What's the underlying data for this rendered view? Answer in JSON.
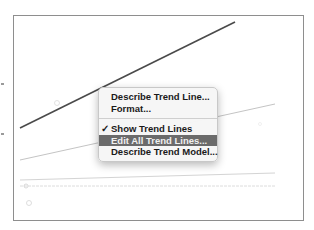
{
  "chart": {
    "frame_color": "#8e8e8e",
    "trend_lines": [
      {
        "name": "trend-line-dark",
        "x1": 20,
        "y1": 128,
        "x2": 235,
        "y2": 22,
        "color": "#4a4a4a",
        "width": 1.6
      },
      {
        "name": "trend-line-light",
        "x1": 20,
        "y1": 160,
        "x2": 275,
        "y2": 104,
        "color": "#c4c4c4",
        "width": 1
      },
      {
        "name": "trend-line-faint-upper",
        "x1": 20,
        "y1": 180,
        "x2": 275,
        "y2": 173,
        "color": "#d4d4d4",
        "width": 1
      },
      {
        "name": "trend-line-faint-lower",
        "x1": 20,
        "y1": 186,
        "x2": 275,
        "y2": 186,
        "color": "#dcdcdc",
        "width": 1
      }
    ],
    "markers": [
      {
        "cx": 57,
        "cy": 103,
        "r": 2.5
      },
      {
        "cx": 26,
        "cy": 186,
        "r": 2
      },
      {
        "cx": 29,
        "cy": 203,
        "r": 2.5
      },
      {
        "cx": 260,
        "cy": 124,
        "r": 1.5
      }
    ],
    "axis_ticks_y": [
      83,
      133
    ]
  },
  "context_menu": {
    "items": [
      {
        "label": "Describe Trend Line...",
        "checked": false,
        "highlighted": false
      },
      {
        "label": "Format...",
        "checked": false,
        "highlighted": false
      },
      {
        "separator": true
      },
      {
        "label": "Show Trend Lines",
        "checked": true,
        "highlighted": false
      },
      {
        "label": "Edit All Trend Lines...",
        "checked": false,
        "highlighted": true
      },
      {
        "label": "Describe Trend Model...",
        "checked": false,
        "highlighted": false
      }
    ],
    "check_glyph": "✓",
    "highlight_color": "#6b6b6b"
  }
}
